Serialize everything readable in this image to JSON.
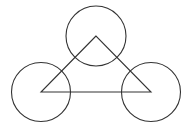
{
  "diagram": {
    "background": "#ffffff",
    "stroke_color": "#333333",
    "triangle": {
      "vertices": [
        {
          "x": 96,
          "y": 36
        },
        {
          "x": 41,
          "y": 92
        },
        {
          "x": 151,
          "y": 92
        }
      ]
    },
    "circles": [
      {
        "name": "top",
        "cx": 96,
        "cy": 36,
        "r": 30
      },
      {
        "name": "left",
        "cx": 41,
        "cy": 92,
        "r": 29.5
      },
      {
        "name": "right",
        "cx": 151,
        "cy": 92,
        "r": 29.5
      }
    ]
  }
}
